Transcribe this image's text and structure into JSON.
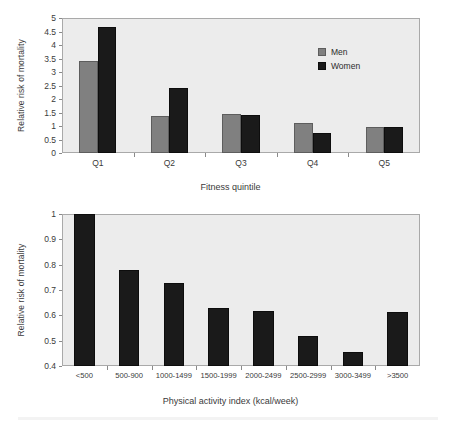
{
  "chart_data": [
    {
      "type": "bar",
      "title": "",
      "xlabel": "Fitness quintile",
      "ylabel": "Relative risk of mortality",
      "categories": [
        "Q1",
        "Q2",
        "Q3",
        "Q4",
        "Q5"
      ],
      "series": [
        {
          "name": "Men",
          "color": "#808080",
          "values": [
            3.4,
            1.38,
            1.44,
            1.12,
            0.98
          ]
        },
        {
          "name": "Women",
          "color": "#1a1a1a",
          "values": [
            4.65,
            2.4,
            1.4,
            0.73,
            0.96
          ]
        }
      ],
      "ylim": [
        0,
        5
      ],
      "yticks": [
        "0",
        "0.5",
        "1",
        "1.5",
        "2",
        "2.5",
        "3",
        "3.5",
        "4",
        "4.5",
        "5"
      ],
      "ytick_values": [
        0,
        0.5,
        1,
        1.5,
        2,
        2.5,
        3,
        3.5,
        4,
        4.5,
        5
      ],
      "grid": false,
      "legend_position": "upper right",
      "legend": [
        "Men",
        "Women"
      ]
    },
    {
      "type": "bar",
      "title": "",
      "xlabel": "Physical activity index (kcal/week)",
      "ylabel": "Relative risk of mortality",
      "categories": [
        "<500",
        "500-900",
        "1000-1499",
        "1500-1999",
        "2000-2499",
        "2500-2999",
        "3000-3499",
        ">3500"
      ],
      "series": [
        {
          "name": "Relative risk of mortality",
          "color": "#1a1a1a",
          "values": [
            1.0,
            0.78,
            0.727,
            0.629,
            0.618,
            0.518,
            0.456,
            0.614
          ]
        }
      ],
      "ylim": [
        0.4,
        1.0
      ],
      "yticks": [
        "0.4",
        "0.5",
        "0.6",
        "0.7",
        "0.8",
        "0.9",
        "1"
      ],
      "ytick_values": [
        0.4,
        0.5,
        0.6,
        0.7,
        0.8,
        0.9,
        1.0
      ],
      "grid": false,
      "legend_position": "none",
      "legend": []
    }
  ]
}
